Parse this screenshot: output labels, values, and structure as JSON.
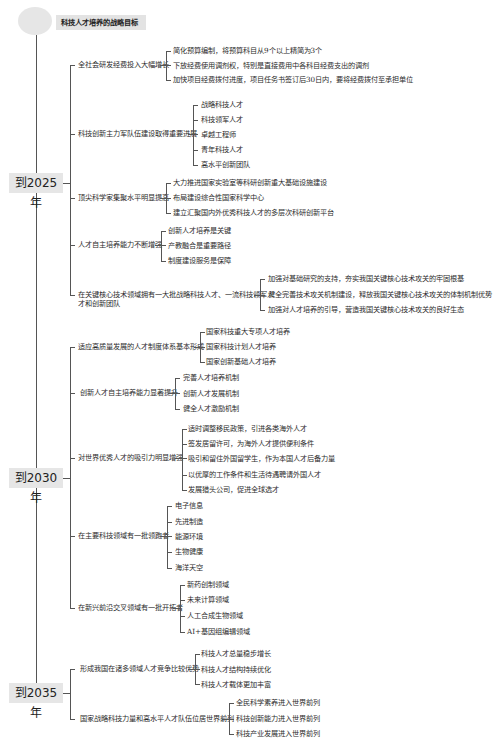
{
  "root": {
    "label": "科技人才培养的战略目标"
  },
  "years": [
    {
      "label": "到2025年",
      "goals": [
        {
          "label": "全社会研发经费投入大幅增长",
          "items": [
            "简化预算编制，将预算科目从9个以上精简为3个",
            "下放经费使用调剂权，特别是直接费用中各科目经费支出的调剂",
            "加快项目经费拨付进度，项目任务书签订后30日内，要将经费拨付至承担单位"
          ]
        },
        {
          "label": "科技创新主力军队伍建设取得重要进展",
          "items": [
            "战略科技人才",
            "科技领军人才",
            "卓越工程师",
            "青年科技人才",
            "高水平创新团队"
          ]
        },
        {
          "label": "顶尖科学家集聚水平明显提高",
          "items": [
            "大力推进国家实验室等科研创新重大基础设施建设",
            "布局建设综合性国家科学中心",
            "建立汇聚国内外优秀科技人才的多层次科研创新平台"
          ]
        },
        {
          "label": "人才自主培养能力不断增强",
          "items": [
            "创新人才培养是关键",
            "产教融合是重要路径",
            "制度建设服务是保障"
          ]
        },
        {
          "label_line1": "在关键核心技术领域拥有一大批战略科技人才、一流科技领军人",
          "label_line2": "才和创新团队",
          "items": [
            "加强对基础研究的支持，夯实我国关键核心技术攻关的牢固根基",
            "健全完善技术攻关机制建设，释放我国关键核心技术攻关的体制机制优势",
            "加强对人才培养的引导，营造我国关键核心技术攻关的良好生态"
          ]
        }
      ]
    },
    {
      "label": "到2030年",
      "goals": [
        {
          "label": "适应高质量发展的人才制度体系基本形成",
          "items": [
            "国家科技重大专项人才培养",
            "国家科技计划人才培养",
            "国家创新基础人才培养"
          ]
        },
        {
          "label": "创新人才自主培养能力显著提升",
          "items": [
            "完善人才培养机制",
            "创新人才发展机制",
            "健全人才激励机制"
          ]
        },
        {
          "label": "对世界优秀人才的吸引力明显增强",
          "items": [
            "适时调整移民政策，引进各类海外人才",
            "签发居留许可，为海外人才提供便利条件",
            "吸引和留住外国留学生，作为本国人才后备力量",
            "以优厚的工作条件和生活待遇聘请外国人才",
            "发展猎头公司，促进全球选才"
          ]
        },
        {
          "label": "在主要科技领域有一批领跑者",
          "items": [
            "电子信息",
            "先进制造",
            "能源环境",
            "生物健康",
            "海洋天空"
          ]
        },
        {
          "label": "在新兴前沿交叉领域有一批开拓者",
          "items": [
            "新药创制领域",
            "未来计算领域",
            "人工合成生物领域",
            "AI+基因组编辑领域"
          ]
        }
      ]
    },
    {
      "label": "到2035年",
      "goals": [
        {
          "label": "形成我国在诸多领域人才竞争比较优势",
          "items": [
            "科技人才总量稳步增长",
            "科技人才结构持续优化",
            "科技人才载体更加丰富"
          ]
        },
        {
          "label": "国家战略科技力量和高水平人才队伍位居世界前列",
          "items": [
            "全民科学素养进入世界前列",
            "科技创新能力进入世界前列",
            "科技产业发展进入世界前列"
          ]
        }
      ]
    }
  ]
}
